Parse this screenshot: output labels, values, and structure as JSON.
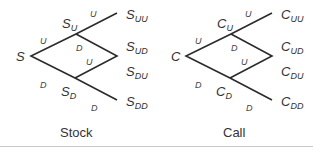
{
  "stock_tree": {
    "root": "S",
    "up_node": {
      "base": "S",
      "sub": "U"
    },
    "down_node": {
      "base": "S",
      "sub": "D"
    },
    "leaves": [
      {
        "base": "S",
        "sub": "UU"
      },
      {
        "base": "S",
        "sub": "UD"
      },
      {
        "base": "S",
        "sub": "DU"
      },
      {
        "base": "S",
        "sub": "DD"
      }
    ],
    "edge_labels": {
      "up": "U",
      "down": "D",
      "uu": "U",
      "ud": "D",
      "du": "U",
      "dd": "D"
    },
    "caption": "Stock"
  },
  "call_tree": {
    "root": "C",
    "up_node": {
      "base": "C",
      "sub": "U"
    },
    "down_node": {
      "base": "C",
      "sub": "D"
    },
    "leaves": [
      {
        "base": "C",
        "sub": "UU"
      },
      {
        "base": "C",
        "sub": "UD"
      },
      {
        "base": "C",
        "sub": "DU"
      },
      {
        "base": "C",
        "sub": "DD"
      }
    ],
    "edge_labels": {
      "up": "U",
      "down": "D",
      "uu": "U",
      "ud": "D",
      "du": "U",
      "dd": "D"
    },
    "caption": "Call"
  }
}
